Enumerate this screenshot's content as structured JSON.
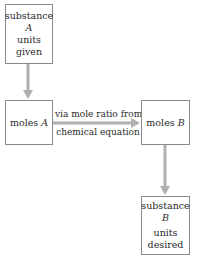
{
  "diagram": {
    "type": "flowchart",
    "boxes": {
      "substance_a": {
        "line1": "substance",
        "line2": "A",
        "line3": "units",
        "line4": "given"
      },
      "moles_a": {
        "prefix": "moles",
        "var": "A"
      },
      "moles_b": {
        "prefix": "moles",
        "var": "B"
      },
      "substance_b": {
        "line1": "substance",
        "line2": "B",
        "line3": "units",
        "line4": "desired"
      }
    },
    "arrows": {
      "conversion_label_line1": "via mole ratio from",
      "conversion_label_line2": "chemical equation"
    },
    "colors": {
      "box_border": "#8a8a8a",
      "arrow": "#b0b0b0",
      "text": "#2a2a2a"
    }
  }
}
